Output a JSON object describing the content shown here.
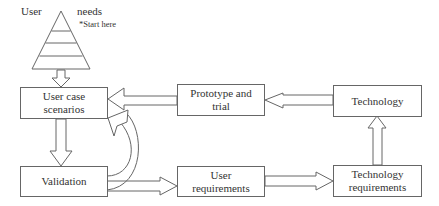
{
  "diagram": {
    "pyramid": {
      "left_label": "User",
      "right_label": "needs",
      "annotation": "*Start here",
      "layers": 5
    },
    "nodes": [
      {
        "id": "user-case-scenarios",
        "label": "User case scenarios"
      },
      {
        "id": "validation",
        "label": "Validation"
      },
      {
        "id": "prototype-and-trial",
        "label": "Prototype and trial"
      },
      {
        "id": "user-requirements",
        "label": "User requirements"
      },
      {
        "id": "technology",
        "label": "Technology"
      },
      {
        "id": "technology-requirements",
        "label": "Technology requirements"
      }
    ],
    "edges": [
      {
        "from": "user-needs-pyramid",
        "to": "user-case-scenarios",
        "style": "hollow-block-arrow"
      },
      {
        "from": "user-case-scenarios",
        "to": "validation",
        "style": "hollow-block-arrow"
      },
      {
        "from": "validation",
        "to": "user-case-scenarios",
        "style": "hollow-curved-arrow"
      },
      {
        "from": "validation",
        "to": "user-requirements",
        "style": "hollow-block-arrow"
      },
      {
        "from": "user-requirements",
        "to": "technology-requirements",
        "style": "hollow-block-arrow"
      },
      {
        "from": "technology-requirements",
        "to": "technology",
        "style": "hollow-block-arrow"
      },
      {
        "from": "technology",
        "to": "prototype-and-trial",
        "style": "hollow-block-arrow"
      },
      {
        "from": "prototype-and-trial",
        "to": "user-case-scenarios",
        "style": "hollow-block-arrow"
      }
    ]
  }
}
